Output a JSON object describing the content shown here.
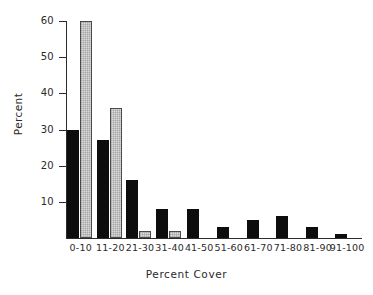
{
  "chart_data": {
    "type": "bar",
    "title": "",
    "xlabel": "Percent Cover",
    "ylabel": "Percent",
    "categories": [
      "0-10",
      "11-20",
      "21-30",
      "31-40",
      "41-50",
      "51-60",
      "61-70",
      "71-80",
      "81-90",
      "91-100"
    ],
    "series": [
      {
        "name": "dark",
        "values": [
          30,
          27,
          16,
          8,
          8,
          3,
          5,
          6,
          3,
          1
        ]
      },
      {
        "name": "light",
        "values": [
          60,
          36,
          2,
          2,
          0,
          0,
          0,
          0,
          0,
          0
        ]
      }
    ],
    "ylim": [
      0,
      60
    ],
    "yticks": [
      10,
      20,
      30,
      40,
      50,
      60
    ],
    "ytick_labels": [
      "10",
      "20",
      "30",
      "40",
      "50",
      "60"
    ],
    "grid": false,
    "legend": "none",
    "colors": {
      "dark": "#0d0d0d",
      "light": "#dcdcdc",
      "light_edge": "#4a4a4a",
      "axis": "#2b2b2b"
    }
  }
}
